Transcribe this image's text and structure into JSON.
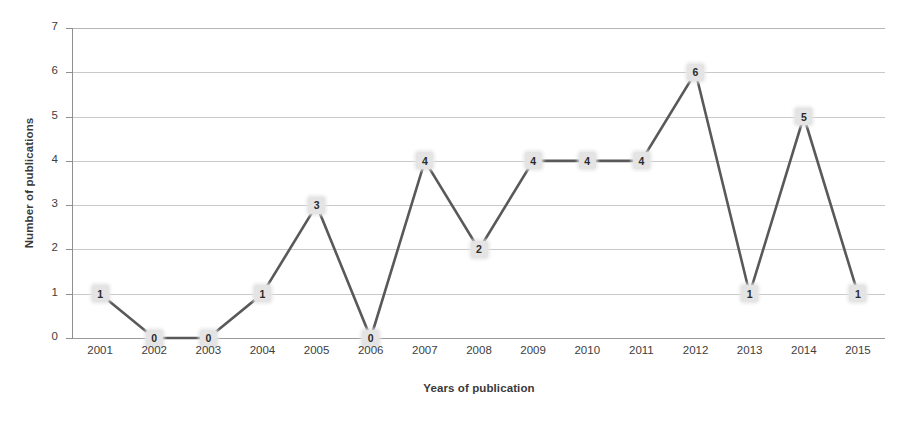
{
  "chart_data": {
    "type": "line",
    "title": "",
    "xlabel": "Years of publication",
    "ylabel": "Number of publications",
    "categories": [
      "2001",
      "2002",
      "2003",
      "2004",
      "2005",
      "2006",
      "2007",
      "2008",
      "2009",
      "2010",
      "2011",
      "2012",
      "2013",
      "2014",
      "2015"
    ],
    "values": [
      1,
      0,
      0,
      1,
      3,
      0,
      4,
      2,
      4,
      4,
      4,
      6,
      1,
      5,
      1
    ],
    "data_labels": [
      "1",
      "0",
      "0",
      "1",
      "3",
      "0",
      "4",
      "2",
      "4",
      "4",
      "4",
      "6",
      "1",
      "5",
      "1"
    ],
    "ylim": [
      0,
      7
    ],
    "y_ticks": [
      "0",
      "1",
      "2",
      "3",
      "4",
      "5",
      "6",
      "7"
    ],
    "grid": "horizontal",
    "legend": "none",
    "series_color": "#595959",
    "gridline_color": "#c9c9c9",
    "marker_label_background": "#e4e4e4",
    "axis_color": "#8f8f8f"
  }
}
